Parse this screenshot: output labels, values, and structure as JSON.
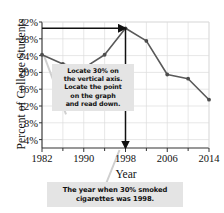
{
  "figure": {
    "ylabel": "Percent of College Students",
    "xlabel": "Year"
  },
  "callouts": {
    "inside": {
      "name": "instruction-callout",
      "lines": [
        "Locate 30% on",
        "the vertical axis.",
        "Locate the point",
        "on the graph",
        "and read down."
      ]
    },
    "bottom": {
      "name": "answer-callout",
      "lines": [
        "The year when 30% smoked",
        "cigarettes was 1998."
      ]
    }
  },
  "colors": {
    "line": "#595959",
    "marker": "#4d4d4d",
    "arrow": "#111111",
    "grid": "#dcdcdc",
    "axis": "#333333",
    "callout_bg": "#e4e4e4",
    "leader": "#cfcfcf"
  },
  "chart_data": {
    "type": "line",
    "title": "",
    "xlabel": "Year",
    "ylabel": "Percent of College Students",
    "x": [
      1982,
      1986,
      1990,
      1994,
      1998,
      2002,
      2006,
      2010,
      2014
    ],
    "values": [
      24.2,
      22.0,
      21.0,
      24.2,
      30.5,
      27.5,
      19.5,
      18.5,
      13.5
    ],
    "xlim": [
      1982,
      2014
    ],
    "ylim": [
      2,
      32
    ],
    "xticks": [
      1982,
      1990,
      1998,
      2006,
      2014
    ],
    "xtick_labels": [
      "1982",
      "1990",
      "1998",
      "2006",
      "2014"
    ],
    "xminorticks": [
      1986,
      1994,
      2002,
      2010
    ],
    "yticks": [
      4,
      8,
      12,
      16,
      20,
      24,
      28,
      32
    ],
    "ytick_labels": [
      "4%",
      "8%",
      "12%",
      "16%",
      "20%",
      "24%",
      "28%",
      "32%"
    ],
    "grid": true,
    "legend": "none",
    "annotations": [
      {
        "name": "horizontal-read-arrow",
        "type": "arrow",
        "from": {
          "x": 1982,
          "y": 30.5
        },
        "to": {
          "x": 1998,
          "y": 30.5
        }
      },
      {
        "name": "vertical-read-arrow",
        "type": "arrow",
        "from": {
          "x": 1998,
          "y": 30.5
        },
        "to": {
          "x": 1998,
          "y": 2
        }
      }
    ],
    "highlight_point": {
      "x": 1998,
      "y": 30.5
    }
  }
}
